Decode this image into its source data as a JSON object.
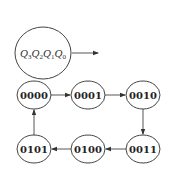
{
  "legend": {
    "label_parts": [
      {
        "main": "Q",
        "sub": "3"
      },
      {
        "main": "Q",
        "sub": "2"
      },
      {
        "main": "Q",
        "sub": "1"
      },
      {
        "main": "Q",
        "sub": "0"
      }
    ]
  },
  "states": [
    {
      "id": "s0",
      "label": "0000"
    },
    {
      "id": "s1",
      "label": "0001"
    },
    {
      "id": "s2",
      "label": "0010"
    },
    {
      "id": "s3",
      "label": "0011"
    },
    {
      "id": "s4",
      "label": "0100"
    },
    {
      "id": "s5",
      "label": "0101"
    }
  ],
  "transitions": [
    {
      "from": "0000",
      "to": "0001"
    },
    {
      "from": "0001",
      "to": "0010"
    },
    {
      "from": "0010",
      "to": "0011"
    },
    {
      "from": "0011",
      "to": "0100"
    },
    {
      "from": "0100",
      "to": "0101"
    },
    {
      "from": "0101",
      "to": "0000"
    }
  ],
  "colors": {
    "stroke": "#444444",
    "text": "#222222",
    "background": "#ffffff"
  }
}
